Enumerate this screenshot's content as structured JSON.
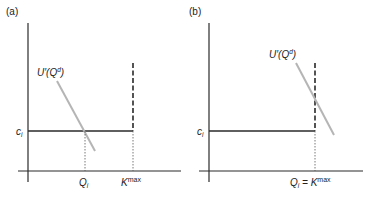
{
  "panels": [
    {
      "id": "a",
      "label": "(a)",
      "y_label": "c",
      "y_label_sub": "i",
      "curve_label_main": "U′(Q",
      "curve_label_sup": "d",
      "curve_label_close": ")",
      "x_labels": [
        {
          "main": "Q",
          "sub": "i"
        },
        {
          "main": "K",
          "sup": "max"
        }
      ]
    },
    {
      "id": "b",
      "label": "(b)",
      "y_label": "c",
      "y_label_sub": "i",
      "curve_label_main": "U′(Q",
      "curve_label_sup": "d",
      "curve_label_close": ")",
      "x_labels": [
        {
          "main": "Q",
          "sub": "i",
          "eq": " = K",
          "sup": "max"
        }
      ]
    }
  ],
  "colors": {
    "axis": "#2a2a2a",
    "supply": "#2a2a2a",
    "demand": "#b5b5b5",
    "dotted": "#555555"
  }
}
